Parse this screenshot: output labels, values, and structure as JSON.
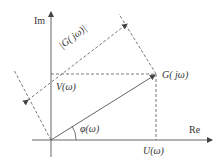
{
  "diagram": {
    "type": "complex-plane-phasor",
    "axes": {
      "imag_label": "Im",
      "real_label": "Re"
    },
    "labels": {
      "point": "G( jω)",
      "magnitude": "|G( jω)|",
      "imag_part": "V(ω)",
      "real_part": "U(ω)",
      "phase": "φ(ω)"
    },
    "colors": {
      "line": "#555555",
      "text": "#333333",
      "background": "#ffffff"
    }
  }
}
